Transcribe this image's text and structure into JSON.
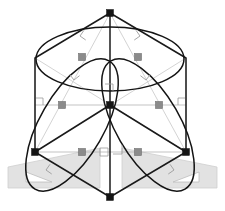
{
  "figure": {
    "kind": "geometric-construction-diagram",
    "canvas": {
      "width": 225,
      "height": 211,
      "background": "#ffffff"
    },
    "colors": {
      "outline": "#1a1a1a",
      "curve": "#141414",
      "guide": "#b4b4b4",
      "marker_gray": "#8b8b8b",
      "marker_dark": "#151515",
      "setsquare_fill": "#e2e2e2",
      "setsquare_stroke": "#cfcfcf",
      "setsquare_hole": "#ffffff"
    }
  },
  "geometry": {
    "hexagon_label": "isometric cube silhouette",
    "hexagon_vertices": [
      {
        "name": "top",
        "x": 110,
        "y": 13
      },
      {
        "name": "upper-right",
        "x": 186,
        "y": 58
      },
      {
        "name": "lower-right",
        "x": 186,
        "y": 152
      },
      {
        "name": "bottom",
        "x": 110,
        "y": 197
      },
      {
        "name": "lower-left",
        "x": 35,
        "y": 152
      },
      {
        "name": "upper-left",
        "x": 35,
        "y": 58
      }
    ],
    "center": {
      "name": "center-vertex",
      "x": 110,
      "y": 105
    },
    "internal_edges": [
      {
        "name": "edge-center-top",
        "from": "center",
        "to": "top"
      },
      {
        "name": "edge-center-lower-left",
        "from": "center",
        "to": "lower-left"
      },
      {
        "name": "edge-center-lower-right",
        "from": "center",
        "to": "lower-right"
      }
    ],
    "vertical_axis": {
      "name": "axis-vertical",
      "x": 110,
      "y1": 13,
      "y2": 197
    },
    "ellipses": [
      {
        "name": "ellipse-top-face",
        "cx": 110,
        "cy": 59,
        "rx": 74,
        "ry": 32,
        "rotation": 0
      },
      {
        "name": "ellipse-left-face",
        "cx": 72,
        "cy": 125,
        "rx": 74,
        "ry": 32,
        "rotation": -60
      },
      {
        "name": "ellipse-right-face",
        "cx": 148,
        "cy": 125,
        "rx": 74,
        "ry": 32,
        "rotation": 60
      }
    ],
    "guide_lines": [
      {
        "name": "guide-horizontal-mid",
        "x1": 35,
        "y1": 105,
        "x2": 186,
        "y2": 105
      },
      {
        "name": "guide-horizontal-lower",
        "x1": 35,
        "y1": 152,
        "x2": 186,
        "y2": 152
      },
      {
        "name": "guide-diagonal-tl-br",
        "x1": 35,
        "y1": 58,
        "x2": 186,
        "y2": 152
      },
      {
        "name": "guide-diagonal-tr-bl",
        "x1": 186,
        "y1": 58,
        "x2": 35,
        "y2": 152
      },
      {
        "name": "guide-diagonal-top-left",
        "x1": 110,
        "y1": 13,
        "x2": 35,
        "y2": 152
      },
      {
        "name": "guide-diagonal-top-right",
        "x1": 110,
        "y1": 13,
        "x2": 186,
        "y2": 152
      }
    ],
    "tangent_nodes": [
      {
        "name": "node-top-left",
        "x": 82,
        "y": 57
      },
      {
        "name": "node-top-right",
        "x": 138,
        "y": 57
      },
      {
        "name": "node-mid-left",
        "x": 62,
        "y": 105
      },
      {
        "name": "node-mid-right",
        "x": 159,
        "y": 105
      },
      {
        "name": "node-low-left",
        "x": 82,
        "y": 152
      },
      {
        "name": "node-low-right",
        "x": 138,
        "y": 152
      }
    ],
    "vertex_nodes": [
      {
        "name": "vertex-node-top",
        "x": 110,
        "y": 13
      },
      {
        "name": "vertex-node-center",
        "x": 110,
        "y": 105
      },
      {
        "name": "vertex-node-bottom",
        "x": 110,
        "y": 197
      },
      {
        "name": "vertex-node-lower-left",
        "x": 35,
        "y": 152
      },
      {
        "name": "vertex-node-lower-right",
        "x": 186,
        "y": 152
      }
    ],
    "right_angle_markers": [
      {
        "name": "right-angle-top-left-inner",
        "x": 80,
        "y": 36,
        "rot": 35
      },
      {
        "name": "right-angle-top-right-inner",
        "x": 140,
        "y": 36,
        "rot": -35
      },
      {
        "name": "right-angle-top-left-outer",
        "x": 74,
        "y": 80,
        "rot": -38
      },
      {
        "name": "right-angle-top-right-outer",
        "x": 146,
        "y": 80,
        "rot": 38
      },
      {
        "name": "right-angle-mid-left",
        "x": 40,
        "y": 103,
        "rot": 0
      },
      {
        "name": "right-angle-mid-right",
        "x": 175,
        "y": 103,
        "rot": 0
      },
      {
        "name": "right-angle-low-left",
        "x": 48,
        "y": 170,
        "rot": 35
      },
      {
        "name": "right-angle-low-right",
        "x": 168,
        "y": 170,
        "rot": -35
      },
      {
        "name": "right-angle-bottom-center-left",
        "x": 100,
        "y": 150,
        "rot": 0
      },
      {
        "name": "right-angle-bottom-center-right",
        "x": 118,
        "y": 147,
        "rot": 0
      }
    ]
  },
  "set_squares": [
    {
      "name": "set-square-left",
      "orientation": "left",
      "outline": "8,167 8,188 100,188 100,148",
      "hole": "26,172 26,182 52,182"
    },
    {
      "name": "set-square-right",
      "orientation": "right",
      "outline": "217,167 217,188 122,188 122,148",
      "hole": "199,172 199,182 173,182"
    }
  ]
}
